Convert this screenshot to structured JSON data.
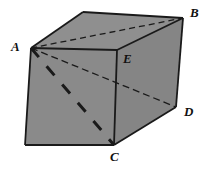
{
  "figure": {
    "kind": "geometry-diagram",
    "shape_name": "rectangular-prism",
    "background_color": "#ffffff",
    "face_fill_color": "#8a8a8a",
    "top_face_fill_color": "#8f8f8f",
    "right_face_fill_color": "#858585",
    "edge_color": "#1a1a1a",
    "dashed_color": "#1a1a1a",
    "vertices": {
      "A": {
        "label": "A",
        "x": 31,
        "y": 48,
        "label_x": 11,
        "label_y": 40
      },
      "B": {
        "label": "B",
        "x": 183,
        "y": 18,
        "label_x": 190,
        "label_y": 6
      },
      "C": {
        "label": "C",
        "x": 114,
        "y": 145,
        "label_x": 110,
        "label_y": 150
      },
      "D": {
        "label": "D",
        "x": 176,
        "y": 107,
        "label_x": 184,
        "label_y": 105
      },
      "E": {
        "label": "E",
        "x": 117,
        "y": 50,
        "label_x": 123,
        "label_y": 52
      }
    },
    "unlabeled_corners": {
      "top_back_left": {
        "x": 83,
        "y": 12
      },
      "bottom_front_left": {
        "x": 25,
        "y": 145
      },
      "front_top_left": {
        "x": 31,
        "y": 48
      },
      "bottom_back_right_hidden": {
        "x": 176,
        "y": 107
      }
    },
    "solid_edges": [
      {
        "name": "top-back-left-to-B",
        "from": "top_back_left",
        "to": "B"
      },
      {
        "name": "A-to-top-back-left",
        "from": "A",
        "to": "top_back_left"
      },
      {
        "name": "A-to-E",
        "from": "A",
        "to": "E"
      },
      {
        "name": "E-to-B",
        "from": "E",
        "to": "B"
      },
      {
        "name": "A-to-bottom-front-left",
        "from": "A",
        "to": "bottom_front_left"
      },
      {
        "name": "bottom-front-left-to-C",
        "from": "bottom_front_left",
        "to": "C"
      },
      {
        "name": "E-to-C",
        "from": "E",
        "to": "C"
      },
      {
        "name": "C-to-D",
        "from": "C",
        "to": "D"
      },
      {
        "name": "B-to-D",
        "from": "B",
        "to": "D"
      }
    ],
    "dashed_edges": [
      {
        "name": "diagonal-A-to-B",
        "from": "A",
        "to": "B",
        "style": "fine-dashed"
      },
      {
        "name": "diagonal-A-to-D",
        "from": "A",
        "to": "D",
        "style": "fine-dashed"
      },
      {
        "name": "diagonal-A-to-C",
        "from": "A",
        "to": "C",
        "style": "heavy-dashed"
      }
    ],
    "labels_order": [
      "A",
      "B",
      "E",
      "D",
      "C"
    ]
  }
}
